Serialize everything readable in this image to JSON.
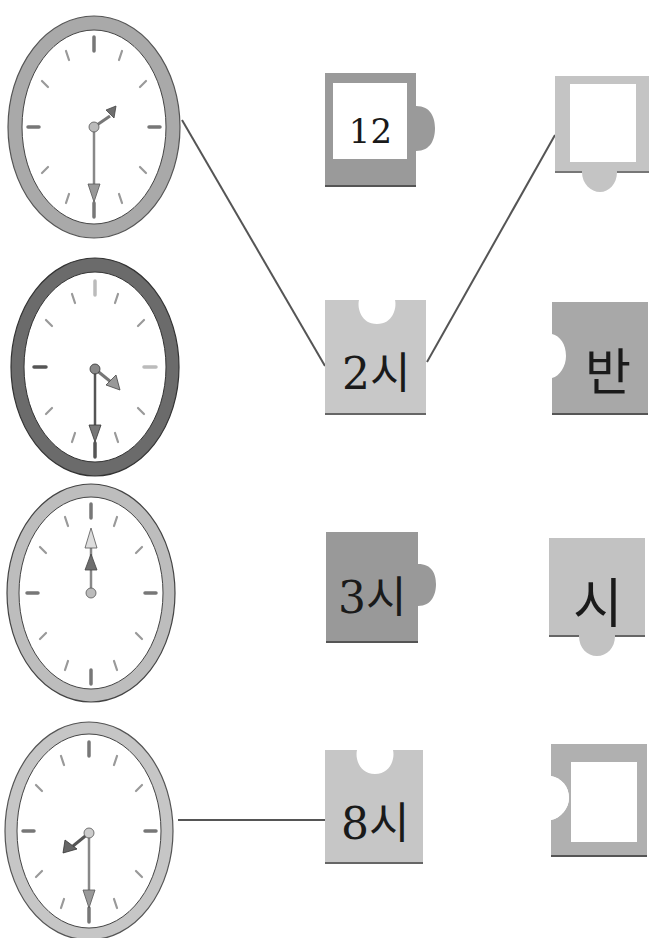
{
  "worksheet": {
    "clocks": [
      {
        "id": "clock-1",
        "rim": "#a9a9a9",
        "hour_angle": 60,
        "minute_angle": 180,
        "time_text": "2:30"
      },
      {
        "id": "clock-2",
        "rim": "#6b6b6b",
        "hour_angle": 120,
        "minute_angle": 180,
        "time_text": "3:30"
      },
      {
        "id": "clock-3",
        "rim": "#bdbdbd",
        "hour_angle": 0,
        "minute_angle": 0,
        "time_text": "12:00"
      },
      {
        "id": "clock-4",
        "rim": "#c6c6c6",
        "hour_angle": 240,
        "minute_angle": 180,
        "time_text": "8:30"
      }
    ],
    "pieces_middle": [
      {
        "label": "12",
        "fill": "#9a9a9a",
        "window": true,
        "tab": "right"
      },
      {
        "label": "2시",
        "fill": "#c8c8c8",
        "window": false,
        "notch": "top"
      },
      {
        "label": "3시",
        "fill": "#999999",
        "window": false,
        "tab": "right"
      },
      {
        "label": "8시",
        "fill": "#c6c6c6",
        "window": false,
        "notch": "top"
      }
    ],
    "pieces_right": [
      {
        "label": "",
        "fill": "#c4c4c4",
        "window": true,
        "tab": "bottom"
      },
      {
        "label": "반",
        "fill": "#a8a8a8",
        "window": false,
        "notch": "left"
      },
      {
        "label": "시",
        "fill": "#c2c2c2",
        "window": false,
        "tab": "bottom"
      },
      {
        "label": "",
        "fill": "#b0b0b0",
        "window": true,
        "notch": "left"
      }
    ],
    "connections": [
      {
        "from": "clock-1",
        "to": "piece-middle-2시"
      },
      {
        "from": "piece-middle-2시",
        "to": "piece-right-empty-top"
      },
      {
        "from": "clock-4",
        "to": "piece-middle-8시"
      }
    ],
    "colors": {
      "line": "#555555",
      "face": "#ffffff",
      "tick": "#8a8a8a",
      "hand_hour": "#6e6e6e",
      "hand_minute": "#9a9a9a"
    }
  }
}
